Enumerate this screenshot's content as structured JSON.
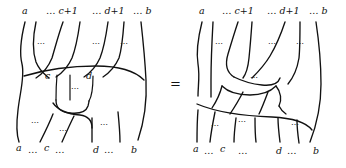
{
  "figure": {
    "type": "braid-tangle-identity-diagram",
    "relation": "=",
    "ellipsis": "…",
    "dots_short": "···",
    "left_diagram": {
      "name": "left-tangle",
      "top_labels": [
        {
          "text": "a"
        },
        {
          "text": "… c+1"
        },
        {
          "text": "… d+1"
        },
        {
          "text": "… b"
        }
      ],
      "inner_labels": [
        {
          "text": "c"
        },
        {
          "text": "d"
        }
      ],
      "bottom_labels": [
        {
          "text": "a"
        },
        {
          "text": "…"
        },
        {
          "text": "c"
        },
        {
          "text": "…"
        },
        {
          "text": "d"
        },
        {
          "text": "…"
        },
        {
          "text": "b"
        }
      ],
      "inner_dots": [
        "⋯",
        "⋯",
        "⋯"
      ],
      "lower_dots": [
        "⋯",
        "⋯",
        "⋯",
        "⋯"
      ]
    },
    "right_diagram": {
      "name": "right-tangle",
      "top_labels": [
        {
          "text": "a"
        },
        {
          "text": "… c+1"
        },
        {
          "text": "… d+1"
        },
        {
          "text": "… b"
        }
      ],
      "bottom_labels": [
        {
          "text": "a"
        },
        {
          "text": "…"
        },
        {
          "text": "c"
        },
        {
          "text": "…"
        },
        {
          "text": "d"
        },
        {
          "text": "…"
        },
        {
          "text": "b"
        }
      ],
      "upper_dots": [
        "⋯",
        "⋯",
        "⋯",
        "⋯"
      ],
      "lower_dots": [
        "⋯",
        "⋯",
        "⋯"
      ]
    },
    "colors": {
      "stroke": "#111111",
      "background": "#ffffff"
    }
  }
}
